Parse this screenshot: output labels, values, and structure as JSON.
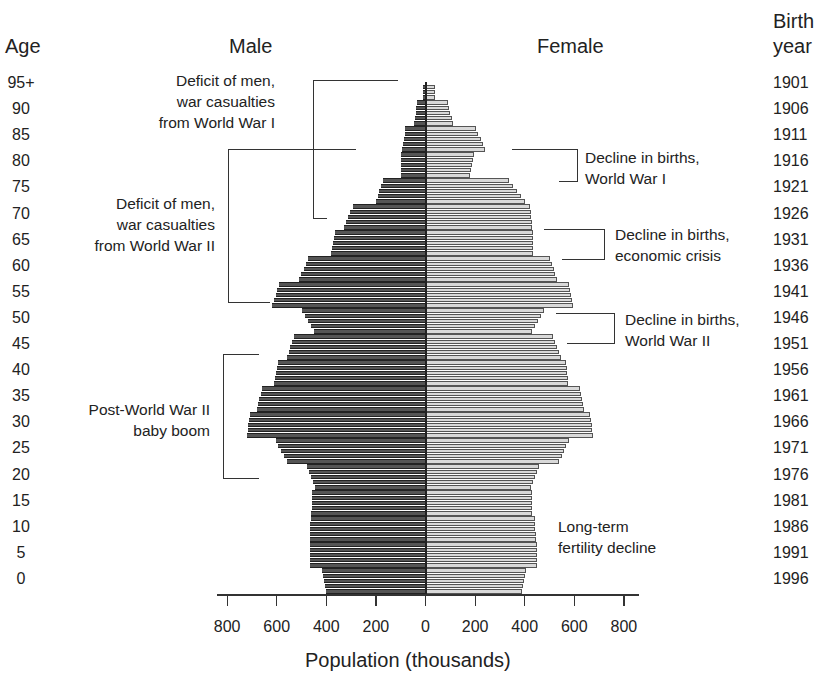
{
  "chart_data": {
    "type": "bar",
    "subtype": "population-pyramid",
    "title": "",
    "xlabel": "Population (thousands)",
    "ylabel_left": "Age",
    "ylabel_right": "Birth year",
    "left_series_label": "Male",
    "right_series_label": "Female",
    "x_ticks": [
      "800",
      "600",
      "400",
      "200",
      "0",
      "200",
      "400",
      "600",
      "800"
    ],
    "xlim": [
      -800,
      800
    ],
    "age_ticks": [
      "95+",
      "90",
      "85",
      "80",
      "75",
      "70",
      "65",
      "60",
      "55",
      "50",
      "45",
      "40",
      "35",
      "30",
      "25",
      "20",
      "15",
      "10",
      "5",
      "0"
    ],
    "birth_year_ticks": [
      "1901",
      "1906",
      "1911",
      "1916",
      "1921",
      "1926",
      "1931",
      "1936",
      "1941",
      "1946",
      "1951",
      "1956",
      "1961",
      "1966",
      "1971",
      "1976",
      "1981",
      "1986",
      "1991",
      "1996"
    ],
    "categories": [
      "0-4",
      "5-9",
      "10-14",
      "15-19",
      "20-24",
      "25-29",
      "30-34",
      "35-39",
      "40-44",
      "45-49",
      "50-54",
      "55-59",
      "60-64",
      "65-69",
      "70-74",
      "75-79",
      "80-84",
      "85-89",
      "90-94",
      "95+"
    ],
    "series": [
      {
        "name": "Male",
        "color": "#555555",
        "values": [
          400,
          465,
          465,
          460,
          445,
          560,
          720,
          680,
          610,
          560,
          450,
          620,
          510,
          380,
          330,
          200,
          100,
          95,
          45,
          10
        ]
      },
      {
        "name": "Female",
        "color": "#d9d9d9",
        "values": [
          390,
          450,
          445,
          430,
          425,
          540,
          675,
          640,
          575,
          545,
          430,
          595,
          530,
          435,
          430,
          400,
          180,
          240,
          110,
          40
        ]
      }
    ],
    "annotations": [
      {
        "text": "Deficit of men, war casualties from World War I",
        "side": "left",
        "ages": "70-95"
      },
      {
        "text": "Deficit of men, war casualties from World War II",
        "side": "left",
        "ages": "55-85"
      },
      {
        "text": "Post-World War II baby boom",
        "side": "left",
        "ages": "20-45"
      },
      {
        "text": "Decline in births, World War I",
        "side": "right",
        "ages": "79-84"
      },
      {
        "text": "Decline in births, economic crisis",
        "side": "right",
        "ages": "64-71"
      },
      {
        "text": "Decline in births, World War II",
        "side": "right",
        "ages": "46-53"
      },
      {
        "text": "Long-term fertility decline",
        "side": "right",
        "ages": "5-15"
      }
    ],
    "grid": false,
    "legend": "none"
  },
  "labels": {
    "age": "Age",
    "male": "Male",
    "female": "Female",
    "birth_line1": "Birth",
    "birth_line2": "year",
    "xlabel": "Population (thousands)",
    "ann_ww1_men": [
      "Deficit of men,",
      "war casualties",
      "from World War I"
    ],
    "ann_ww2_men": [
      "Deficit of men,",
      "war casualties",
      "from World War II"
    ],
    "ann_boom": [
      "Post-World War II",
      "baby boom"
    ],
    "ann_ww1_births": [
      "Decline in births,",
      "World War I"
    ],
    "ann_crisis": [
      "Decline in births,",
      "economic crisis"
    ],
    "ann_ww2_births": [
      "Decline in births,",
      "World War II"
    ],
    "ann_fertility": [
      "Long-term",
      "fertility decline"
    ]
  }
}
